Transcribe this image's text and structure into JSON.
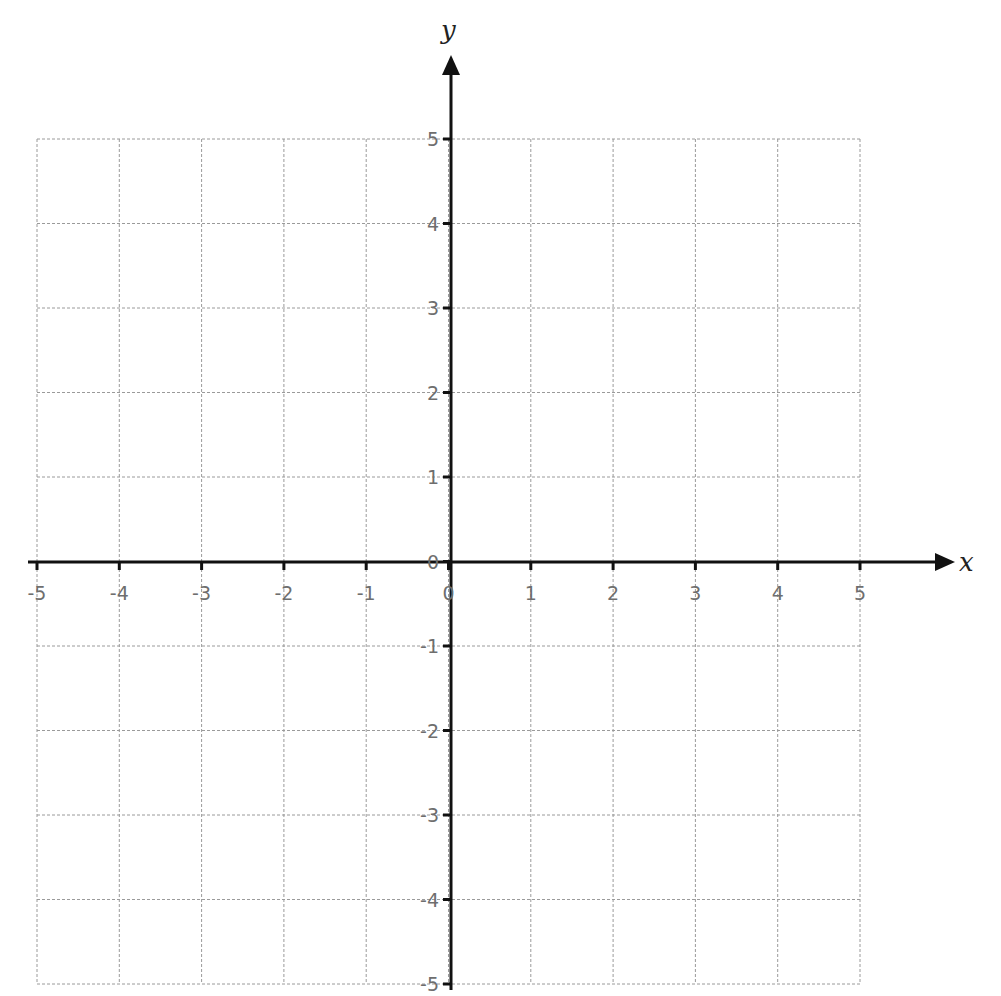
{
  "chart_data": {
    "type": "scatter",
    "title": "",
    "xlabel": "x",
    "ylabel": "y",
    "xlim": [
      -5,
      5
    ],
    "ylim": [
      -5,
      5
    ],
    "grid": true,
    "x_ticks": [
      -5,
      -4,
      -3,
      -2,
      -1,
      0,
      1,
      2,
      3,
      4,
      5
    ],
    "y_ticks": [
      -5,
      -4,
      -3,
      -2,
      -1,
      0,
      1,
      2,
      3,
      4,
      5
    ],
    "x_tick_labels": [
      "-5",
      "-4",
      "-3",
      "-2",
      "-1",
      "0",
      "1",
      "2",
      "3",
      "4",
      "5"
    ],
    "y_tick_labels": [
      "-5",
      "-4",
      "-3",
      "-2",
      "-1",
      "0",
      "1",
      "2",
      "3",
      "4",
      "5"
    ],
    "series": [],
    "legend": null
  },
  "layout": {
    "x_pixel_min": 37,
    "x_pixel_max": 860,
    "y_pixel_top": 139,
    "y_pixel_bottom": 984,
    "origin_px": [
      451,
      562
    ],
    "x_axis_start_px": 28,
    "x_axis_end_px": 955,
    "y_axis_top_px": 55,
    "y_axis_bottom_px": 990
  },
  "colors": {
    "grid": "#9a9a9a",
    "axis": "#111111",
    "tick_label": "#6e6e6e",
    "axis_name": "#222222"
  }
}
